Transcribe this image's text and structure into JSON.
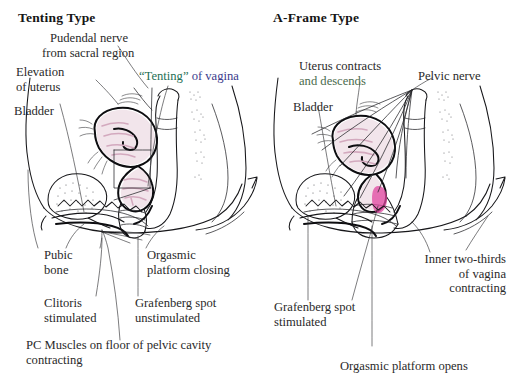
{
  "figure": {
    "kind": "anatomical-diagram",
    "background_color": "#ffffff",
    "ink_color": "#17171a",
    "accent_colors": {
      "mauve_shading": "#d3a9be",
      "magenta_gspot": "#e046a0",
      "tenting_green": "#1f6f55",
      "tenting_blue": "#3b3b8c",
      "descends_green": "#4a6b4d"
    }
  },
  "left_panel": {
    "title": "Tenting Type",
    "labels": {
      "pudendal_nerve": {
        "line1": "Pudendal nerve",
        "line2": "from sacral region"
      },
      "elevation_of_uterus": {
        "line1": "Elevation",
        "line2": "of uterus"
      },
      "bladder": "Bladder",
      "tenting_of_vagina": {
        "quoted": "“Tenting”",
        "rest": " of vagina"
      },
      "pubic_bone": {
        "line1": "Pubic",
        "line2": "bone"
      },
      "orgasmic_platform": {
        "line1": "Orgasmic",
        "line2": "platform closing"
      },
      "clitoris": {
        "line1": "Clitoris",
        "line2": "stimulated"
      },
      "grafenberg_spot": {
        "line1": "Grafenberg spot",
        "line2": "unstimulated"
      },
      "pc_muscles": {
        "line1": "PC Muscles on floor of pelvic cavity",
        "line2": "contracting"
      }
    }
  },
  "right_panel": {
    "title": "A-Frame Type",
    "labels": {
      "uterus_contracts": {
        "line1": "Uterus contracts",
        "line2": "and descends"
      },
      "bladder": "Bladder",
      "pelvic_nerve": "Pelvic nerve",
      "grafenberg_spot": {
        "line1": "Grafenberg spot",
        "line2": "stimulated"
      },
      "inner_two_thirds": {
        "line1": "Inner two-thirds",
        "line2": "of vagina",
        "line3": "contracting"
      },
      "orgasmic_platform": "Orgasmic platform opens"
    }
  }
}
